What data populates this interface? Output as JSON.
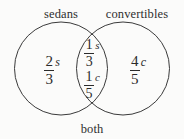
{
  "figure": {
    "type": "venn-diagram",
    "title": "",
    "background_color": "#fbfbfa",
    "stroke_color": "#333333"
  },
  "labels": {
    "left_set": "sedans",
    "right_set": "convertibles",
    "intersection": "both"
  },
  "regions": {
    "left_only": {
      "numerator": "2",
      "denominator": "3",
      "variable": "s"
    },
    "intersection_top": {
      "numerator": "1",
      "denominator": "3",
      "variable": "s"
    },
    "intersection_bottom": {
      "numerator": "1",
      "denominator": "5",
      "variable": "c"
    },
    "right_only": {
      "numerator": "4",
      "denominator": "5",
      "variable": "c"
    }
  }
}
